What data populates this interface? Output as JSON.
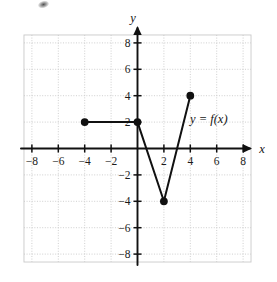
{
  "figure": {
    "title": "",
    "axis_labels": {
      "x": "x",
      "y": "y"
    },
    "function_label": "y = f(x)",
    "artifact": "scan-smudge"
  },
  "chart_data": {
    "type": "line",
    "title": "",
    "xlabel": "x",
    "ylabel": "y",
    "xlim": [
      -10,
      10
    ],
    "ylim": [
      -10,
      10
    ],
    "grid": true,
    "grid_step": 2,
    "legend_position": "inline-annotation",
    "annotations": [
      {
        "text": "y = f(x)",
        "x": 4.6,
        "y": 3.0
      }
    ],
    "xticks": [
      -8,
      -6,
      -4,
      -2,
      2,
      4,
      6,
      8
    ],
    "xtick_labels": [
      "-8",
      "-6",
      "-4",
      "-2",
      "2",
      "4",
      "6",
      "8"
    ],
    "yticks": [
      8,
      6,
      4,
      2,
      -2,
      -4,
      -6,
      -8
    ],
    "ytick_labels": [
      "8",
      "6",
      "4",
      "2",
      "-2",
      "-4",
      "-6",
      "-8"
    ],
    "series": [
      {
        "name": "f(x)",
        "points": [
          {
            "x": -4,
            "y": 2
          },
          {
            "x": 0,
            "y": 2
          },
          {
            "x": 2,
            "y": -4
          },
          {
            "x": 4,
            "y": 4
          }
        ],
        "endpoint_markers": [
          {
            "x": -4,
            "y": 2,
            "style": "closed"
          },
          {
            "x": 0,
            "y": 2,
            "style": "closed"
          },
          {
            "x": 2,
            "y": -4,
            "style": "closed"
          },
          {
            "x": 4,
            "y": 4,
            "style": "closed"
          }
        ]
      }
    ],
    "colors": {
      "curve": "#111111",
      "axis": "#111111",
      "grid": "#c9c9c9",
      "background": "#ffffff"
    }
  }
}
